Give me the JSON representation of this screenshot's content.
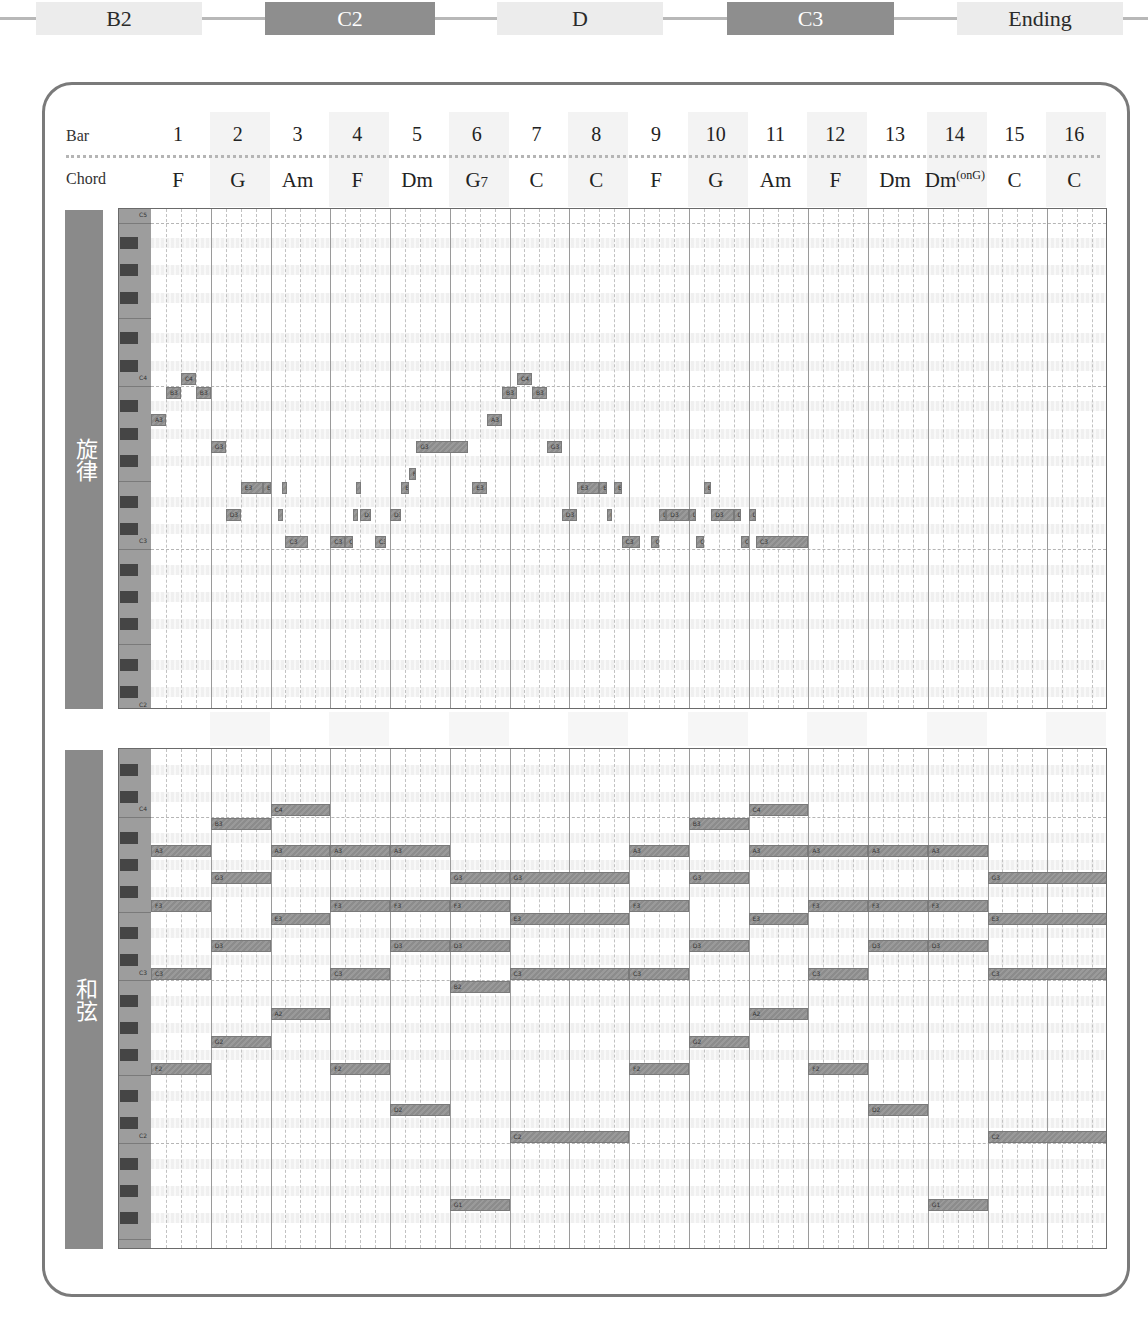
{
  "sections": [
    {
      "label": "B2",
      "style": "light",
      "x": 36,
      "w": 166
    },
    {
      "label": "C2",
      "style": "dark",
      "x": 265,
      "w": 170
    },
    {
      "label": "D",
      "style": "light",
      "x": 497,
      "w": 166
    },
    {
      "label": "C3",
      "style": "dark",
      "x": 727,
      "w": 167
    },
    {
      "label": "Ending",
      "style": "light",
      "x": 957,
      "w": 166
    }
  ],
  "header": {
    "bar_label": "Bar",
    "chord_label": "Chord",
    "bars": [
      "1",
      "2",
      "3",
      "4",
      "5",
      "6",
      "7",
      "8",
      "9",
      "10",
      "11",
      "12",
      "13",
      "14",
      "15",
      "16"
    ],
    "chords": [
      {
        "name": "F"
      },
      {
        "name": "G"
      },
      {
        "name": "Am"
      },
      {
        "name": "F"
      },
      {
        "name": "Dm"
      },
      {
        "name": "G7"
      },
      {
        "name": "C"
      },
      {
        "name": "C"
      },
      {
        "name": "F"
      },
      {
        "name": "G"
      },
      {
        "name": "Am"
      },
      {
        "name": "F"
      },
      {
        "name": "Dm"
      },
      {
        "name": "Dm",
        "sup": "(onG)"
      },
      {
        "name": "C"
      },
      {
        "name": "C"
      }
    ]
  },
  "panels": {
    "melody": {
      "label": "旋律",
      "octave_labels": [
        "C4",
        "C3",
        "C2"
      ]
    },
    "chords": {
      "label": "和弦",
      "octave_labels": [
        "C4",
        "C3",
        "C2"
      ]
    }
  },
  "chart_data": {
    "type": "piano-roll",
    "xlabel": "Bar",
    "bars": 16,
    "subdivisions_per_bar": 4,
    "chord_progression": [
      "F",
      "G",
      "Am",
      "F",
      "Dm",
      "G7",
      "C",
      "C",
      "F",
      "G",
      "Am",
      "F",
      "Dm",
      "Dm(onG)",
      "C",
      "C"
    ],
    "melody": [
      {
        "pitch": "A3",
        "bar": 1,
        "start": 0,
        "len": 1
      },
      {
        "pitch": "B3",
        "bar": 1,
        "start": 1,
        "len": 1
      },
      {
        "pitch": "C4",
        "bar": 1,
        "start": 2,
        "len": 1
      },
      {
        "pitch": "B3",
        "bar": 1,
        "start": 3,
        "len": 1
      },
      {
        "pitch": "G3",
        "bar": 2,
        "start": 0,
        "len": 1
      },
      {
        "pitch": "D3",
        "bar": 2,
        "start": 1,
        "len": 1
      },
      {
        "pitch": "E3",
        "bar": 2,
        "start": 2,
        "len": 1.5
      },
      {
        "pitch": "E3",
        "bar": 2,
        "start": 3.5,
        "len": 0.5
      },
      {
        "pitch": "D3",
        "bar": 3,
        "start": 0.5,
        "len": 0.25
      },
      {
        "pitch": "E3",
        "bar": 3,
        "start": 0.75,
        "len": 0.25
      },
      {
        "pitch": "C3",
        "bar": 3,
        "start": 1,
        "len": 1.5
      },
      {
        "pitch": "C3",
        "bar": 4,
        "start": 0,
        "len": 1
      },
      {
        "pitch": "C3",
        "bar": 4,
        "start": 1,
        "len": 0.5
      },
      {
        "pitch": "D3",
        "bar": 4,
        "start": 1.5,
        "len": 0.25
      },
      {
        "pitch": "E3",
        "bar": 4,
        "start": 1.75,
        "len": 0.25
      },
      {
        "pitch": "D3",
        "bar": 4,
        "start": 2,
        "len": 0.75
      },
      {
        "pitch": "C3",
        "bar": 4,
        "start": 3,
        "len": 0.75
      },
      {
        "pitch": "D3",
        "bar": 5,
        "start": 0,
        "len": 0.75
      },
      {
        "pitch": "E3",
        "bar": 5,
        "start": 0.75,
        "len": 0.5
      },
      {
        "pitch": "F3",
        "bar": 5,
        "start": 1.25,
        "len": 0.5
      },
      {
        "pitch": "G3",
        "bar": 5,
        "start": 1.75,
        "len": 3.5
      },
      {
        "pitch": "E3",
        "bar": 6,
        "start": 1.5,
        "len": 1
      },
      {
        "pitch": "A3",
        "bar": 6,
        "start": 2.5,
        "len": 1
      },
      {
        "pitch": "B3",
        "bar": 6,
        "start": 3.5,
        "len": 1
      },
      {
        "pitch": "C4",
        "bar": 7,
        "start": 0.5,
        "len": 1
      },
      {
        "pitch": "B3",
        "bar": 7,
        "start": 1.5,
        "len": 1
      },
      {
        "pitch": "G3",
        "bar": 7,
        "start": 2.5,
        "len": 1
      },
      {
        "pitch": "D3",
        "bar": 7,
        "start": 3.5,
        "len": 1
      },
      {
        "pitch": "E3",
        "bar": 8,
        "start": 0.5,
        "len": 1.5
      },
      {
        "pitch": "E3",
        "bar": 8,
        "start": 2,
        "len": 0.5
      },
      {
        "pitch": "D3",
        "bar": 8,
        "start": 2.5,
        "len": 0.25
      },
      {
        "pitch": "E3",
        "bar": 8,
        "start": 3,
        "len": 0.5
      },
      {
        "pitch": "C3",
        "bar": 8,
        "start": 3.5,
        "len": 1.25
      },
      {
        "pitch": "C3",
        "bar": 9,
        "start": 1.5,
        "len": 0.5
      },
      {
        "pitch": "D3",
        "bar": 9,
        "start": 2,
        "len": 0.5
      },
      {
        "pitch": "D3",
        "bar": 9,
        "start": 2.5,
        "len": 1.5
      },
      {
        "pitch": "D3",
        "bar": 10,
        "start": 0,
        "len": 0.5
      },
      {
        "pitch": "C3",
        "bar": 10,
        "start": 0.5,
        "len": 0.5
      },
      {
        "pitch": "E3",
        "bar": 10,
        "start": 1,
        "len": 0.5
      },
      {
        "pitch": "D3",
        "bar": 10,
        "start": 1.5,
        "len": 1.5
      },
      {
        "pitch": "D3",
        "bar": 10,
        "start": 3,
        "len": 0.5
      },
      {
        "pitch": "C3",
        "bar": 10,
        "start": 3.5,
        "len": 0.5
      },
      {
        "pitch": "D3",
        "bar": 11,
        "start": 0,
        "len": 0.5
      },
      {
        "pitch": "C3",
        "bar": 11,
        "start": 0.5,
        "len": 3.5
      }
    ],
    "chords": [
      {
        "pitches": [
          "A3",
          "F3",
          "C3",
          "F2"
        ],
        "bar": 1,
        "len": 1
      },
      {
        "pitches": [
          "B3",
          "G3",
          "D3",
          "G2"
        ],
        "bar": 2,
        "len": 1
      },
      {
        "pitches": [
          "C4",
          "A3",
          "E3",
          "A2"
        ],
        "bar": 3,
        "len": 1
      },
      {
        "pitches": [
          "A3",
          "F3",
          "C3",
          "F2"
        ],
        "bar": 4,
        "len": 1
      },
      {
        "pitches": [
          "A3",
          "F3",
          "D3",
          "D2"
        ],
        "bar": 5,
        "len": 1
      },
      {
        "pitches": [
          "G3",
          "F3",
          "D3",
          "B2",
          "G1"
        ],
        "bar": 6,
        "len": 1
      },
      {
        "pitches": [
          "G3",
          "E3",
          "C3",
          "C2"
        ],
        "bar": 7,
        "len": 2
      },
      {
        "pitches": [
          "A3",
          "F3",
          "C3",
          "F2"
        ],
        "bar": 9,
        "len": 1
      },
      {
        "pitches": [
          "B3",
          "G3",
          "D3",
          "G2"
        ],
        "bar": 10,
        "len": 1
      },
      {
        "pitches": [
          "C4",
          "A3",
          "E3",
          "A2"
        ],
        "bar": 11,
        "len": 1
      },
      {
        "pitches": [
          "A3",
          "F3",
          "C3",
          "F2"
        ],
        "bar": 12,
        "len": 1
      },
      {
        "pitches": [
          "A3",
          "F3",
          "D3",
          "D2"
        ],
        "bar": 13,
        "len": 1
      },
      {
        "pitches": [
          "A3",
          "F3",
          "D3",
          "G1"
        ],
        "bar": 14,
        "len": 1
      },
      {
        "pitches": [
          "G3",
          "E3",
          "C3",
          "C2"
        ],
        "bar": 15,
        "len": 2
      }
    ]
  }
}
